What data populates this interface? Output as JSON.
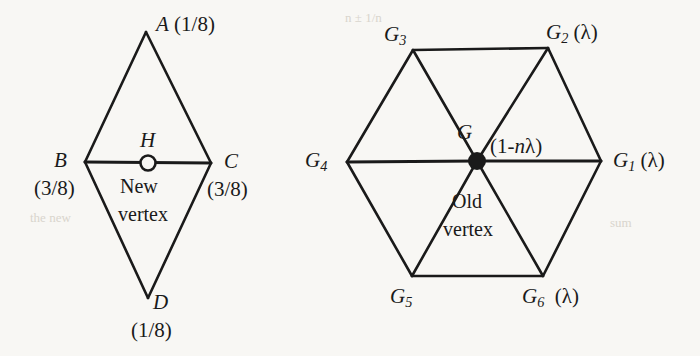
{
  "figure": {
    "background_color": "#f8f7f4",
    "stroke_color": "#1a1a1a",
    "left_diagram": {
      "name": "new-vertex-mask",
      "vertices": [
        {
          "id": "A",
          "label": "A",
          "weight": "(1/8)",
          "x": 146,
          "y": 32
        },
        {
          "id": "B",
          "label": "B",
          "weight": "(3/8)",
          "x": 85,
          "y": 162
        },
        {
          "id": "C",
          "label": "C",
          "weight": "(3/8)",
          "x": 211,
          "y": 163
        },
        {
          "id": "D",
          "label": "D",
          "weight": "(1/8)",
          "x": 148,
          "y": 298
        }
      ],
      "center": {
        "id": "H",
        "label": "H",
        "x": 148,
        "y": 163,
        "marker": "open-circle",
        "caption_line1": "New",
        "caption_line2": "vertex"
      },
      "edges": [
        [
          "A",
          "B"
        ],
        [
          "A",
          "C"
        ],
        [
          "B",
          "D"
        ],
        [
          "C",
          "D"
        ],
        [
          "B",
          "C"
        ]
      ]
    },
    "right_diagram": {
      "name": "old-vertex-mask",
      "vertices": [
        {
          "id": "G1",
          "label": "G",
          "sub": "1",
          "weight": "(λ)",
          "x": 601,
          "y": 161
        },
        {
          "id": "G2",
          "label": "G",
          "sub": "2",
          "weight": "(λ)",
          "x": 548,
          "y": 48
        },
        {
          "id": "G3",
          "label": "G",
          "sub": "3",
          "weight": "",
          "x": 413,
          "y": 50
        },
        {
          "id": "G4",
          "label": "G",
          "sub": "4",
          "weight": "",
          "x": 347,
          "y": 162
        },
        {
          "id": "G5",
          "label": "G",
          "sub": "5",
          "weight": "",
          "x": 412,
          "y": 276
        },
        {
          "id": "G6",
          "label": "G",
          "sub": "6",
          "weight": "(λ)",
          "x": 543,
          "y": 276
        }
      ],
      "center": {
        "id": "G",
        "label": "G",
        "x": 477,
        "y": 161,
        "marker": "filled-circle",
        "weight": "(1-nλ)",
        "weight_prefix": "(1-",
        "weight_italic": "n",
        "weight_suffix": "λ)",
        "caption_line1": "Old",
        "caption_line2": "vertex"
      },
      "edges": [
        [
          "G1",
          "G2"
        ],
        [
          "G2",
          "G3"
        ],
        [
          "G3",
          "G4"
        ],
        [
          "G4",
          "G5"
        ],
        [
          "G5",
          "G6"
        ],
        [
          "G6",
          "G1"
        ],
        [
          "G",
          "G1"
        ],
        [
          "G",
          "G2"
        ],
        [
          "G",
          "G3"
        ],
        [
          "G",
          "G4"
        ],
        [
          "G",
          "G5"
        ],
        [
          "G",
          "G6"
        ]
      ]
    }
  }
}
